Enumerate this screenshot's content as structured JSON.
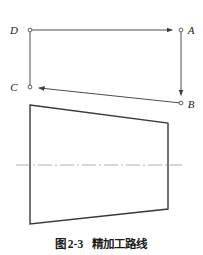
{
  "figure": {
    "caption_prefix": "图",
    "caption_number": "2-3",
    "caption_title": "精加工路线",
    "line_color": "#3a3a3a",
    "centerline_color": "#9a9a9a",
    "label_color": "#1a1a1a",
    "background_color": "#ffffff"
  },
  "toolpath_diagram": {
    "name": "tool path ADCB",
    "vertices": [
      {
        "id": "D",
        "label": "D",
        "x": 30,
        "y": 30,
        "label_x": 14,
        "label_y": 34
      },
      {
        "id": "A",
        "label": "A",
        "x": 181,
        "y": 30,
        "label_x": 188,
        "label_y": 34
      },
      {
        "id": "C",
        "label": "C",
        "x": 30,
        "y": 87,
        "label_x": 14,
        "label_y": 91
      },
      {
        "id": "B",
        "label": "B",
        "x": 181,
        "y": 103,
        "label_x": 188,
        "label_y": 108
      }
    ],
    "segments": [
      {
        "from": "D",
        "to": "A",
        "arrow": true
      },
      {
        "from": "A",
        "to": "B",
        "arrow": true
      },
      {
        "from": "B",
        "to": "C",
        "arrow": true
      },
      {
        "from": "D",
        "to": "C",
        "arrow": false
      }
    ]
  },
  "workpiece_profile": {
    "name": "tapered workpiece outline",
    "corners": [
      {
        "x": 30,
        "y": 105
      },
      {
        "x": 168,
        "y": 123
      },
      {
        "x": 168,
        "y": 209
      },
      {
        "x": 30,
        "y": 224
      }
    ],
    "centerline": {
      "x1": 16,
      "y1": 165,
      "x2": 182,
      "y2": 165
    }
  }
}
